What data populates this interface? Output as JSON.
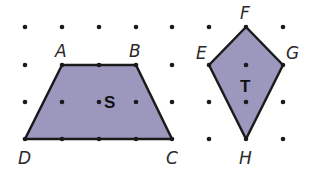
{
  "figure": {
    "fill_color": "#9b97bd",
    "stroke_color": "#1a1a1a",
    "dot_color": "#1a1a1a",
    "shapes": [
      {
        "name": "S",
        "type": "trapezoid",
        "vertices": [
          {
            "label": "A",
            "x": 62,
            "y": 65
          },
          {
            "label": "B",
            "x": 136,
            "y": 65
          },
          {
            "label": "C",
            "x": 172,
            "y": 139
          },
          {
            "label": "D",
            "x": 25,
            "y": 139
          }
        ]
      },
      {
        "name": "T",
        "type": "kite",
        "vertices": [
          {
            "label": "F",
            "x": 246,
            "y": 27
          },
          {
            "label": "G",
            "x": 283,
            "y": 65
          },
          {
            "label": "H",
            "x": 246,
            "y": 139
          },
          {
            "label": "E",
            "x": 209,
            "y": 65
          }
        ]
      }
    ]
  }
}
